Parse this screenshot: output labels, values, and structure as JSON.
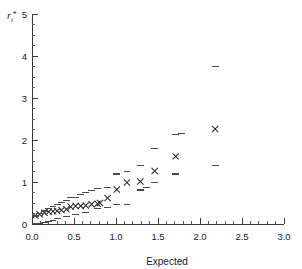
{
  "figure": {
    "background": "#ffffff",
    "marker_color": "#2b2b2b",
    "envelope_color": "#4a4a4a",
    "axis_color": "#3a3a3a"
  },
  "chart_data": {
    "type": "scatter",
    "title": "",
    "subtitle": "",
    "xlabel": "Expected",
    "ylabel": "r*",
    "ylabel_full": "r_i*",
    "xlim": [
      0.0,
      3.0
    ],
    "ylim": [
      0.0,
      5.0
    ],
    "grid": false,
    "legend": null,
    "legend_position": "none",
    "xticks": [
      0.0,
      0.5,
      1.0,
      1.5,
      2.0,
      2.5,
      3.0
    ],
    "xticklabels": [
      "0.0",
      "0.5",
      "1.0",
      "1.5",
      "2.0",
      "2.5",
      "3.0"
    ],
    "xtick_minor_step": 0.1,
    "yticks": [
      0,
      1,
      2,
      3,
      4,
      5
    ],
    "yticklabels": [
      "0",
      "1",
      "2",
      "3",
      "4",
      "5"
    ],
    "ytick_minor_step": 0.25,
    "series": [
      {
        "name": "Observed",
        "marker": "x",
        "color": "#2b2b2b",
        "points": [
          {
            "x": 0.04,
            "y": 0.2
          },
          {
            "x": 0.09,
            "y": 0.23
          },
          {
            "x": 0.15,
            "y": 0.27
          },
          {
            "x": 0.2,
            "y": 0.29
          },
          {
            "x": 0.25,
            "y": 0.3
          },
          {
            "x": 0.3,
            "y": 0.31
          },
          {
            "x": 0.35,
            "y": 0.33
          },
          {
            "x": 0.41,
            "y": 0.35
          },
          {
            "x": 0.46,
            "y": 0.41
          },
          {
            "x": 0.52,
            "y": 0.43
          },
          {
            "x": 0.58,
            "y": 0.43
          },
          {
            "x": 0.64,
            "y": 0.44
          },
          {
            "x": 0.71,
            "y": 0.47
          },
          {
            "x": 0.78,
            "y": 0.48
          },
          {
            "x": 0.81,
            "y": 0.5
          },
          {
            "x": 0.9,
            "y": 0.62
          },
          {
            "x": 1.01,
            "y": 0.82
          },
          {
            "x": 1.13,
            "y": 0.99
          },
          {
            "x": 1.29,
            "y": 1.01
          },
          {
            "x": 1.46,
            "y": 1.26
          },
          {
            "x": 1.71,
            "y": 1.61
          },
          {
            "x": 2.18,
            "y": 2.26
          }
        ]
      },
      {
        "name": "Simulation envelope upper",
        "marker": "dash",
        "color": "#4a4a4a",
        "points": [
          {
            "x": 0.04,
            "y": 0.19
          },
          {
            "x": 0.09,
            "y": 0.25
          },
          {
            "x": 0.15,
            "y": 0.31
          },
          {
            "x": 0.2,
            "y": 0.36
          },
          {
            "x": 0.25,
            "y": 0.41
          },
          {
            "x": 0.3,
            "y": 0.47
          },
          {
            "x": 0.35,
            "y": 0.51
          },
          {
            "x": 0.41,
            "y": 0.56
          },
          {
            "x": 0.46,
            "y": 0.63
          },
          {
            "x": 0.52,
            "y": 0.64
          },
          {
            "x": 0.58,
            "y": 0.7
          },
          {
            "x": 0.64,
            "y": 0.74
          },
          {
            "x": 0.71,
            "y": 0.8
          },
          {
            "x": 0.78,
            "y": 0.84
          },
          {
            "x": 0.9,
            "y": 0.87
          },
          {
            "x": 1.01,
            "y": 1.19
          },
          {
            "x": 1.13,
            "y": 1.26
          },
          {
            "x": 1.29,
            "y": 1.39
          },
          {
            "x": 1.46,
            "y": 1.8
          },
          {
            "x": 1.71,
            "y": 2.13
          },
          {
            "x": 1.78,
            "y": 2.16
          },
          {
            "x": 2.18,
            "y": 3.76
          }
        ]
      },
      {
        "name": "Simulation envelope lower",
        "marker": "dash",
        "color": "#4a4a4a",
        "points": [
          {
            "x": 0.04,
            "y": 0.02
          },
          {
            "x": 0.09,
            "y": 0.02
          },
          {
            "x": 0.15,
            "y": 0.04
          },
          {
            "x": 0.2,
            "y": 0.06
          },
          {
            "x": 0.25,
            "y": 0.09
          },
          {
            "x": 0.3,
            "y": 0.12
          },
          {
            "x": 0.41,
            "y": 0.17
          },
          {
            "x": 0.52,
            "y": 0.22
          },
          {
            "x": 0.64,
            "y": 0.27
          },
          {
            "x": 0.78,
            "y": 0.37
          },
          {
            "x": 0.9,
            "y": 0.4
          },
          {
            "x": 1.01,
            "y": 0.46
          },
          {
            "x": 1.13,
            "y": 0.46
          },
          {
            "x": 1.29,
            "y": 0.81
          },
          {
            "x": 1.36,
            "y": 0.86
          },
          {
            "x": 1.46,
            "y": 0.99
          },
          {
            "x": 1.71,
            "y": 1.19
          },
          {
            "x": 2.18,
            "y": 1.4
          }
        ]
      }
    ]
  }
}
